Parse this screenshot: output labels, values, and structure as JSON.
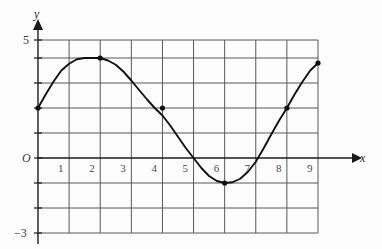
{
  "figure": {
    "axis_label_x": "x",
    "axis_label_y": "y",
    "origin_label": "O",
    "y_top_label": "5",
    "y_bottom_label": "−3"
  },
  "chart_data": {
    "type": "line",
    "title": "",
    "xlabel": "x",
    "ylabel": "y",
    "xlim": [
      0,
      9
    ],
    "ylim": [
      -3,
      5
    ],
    "grid": true,
    "legend": "none",
    "xticks": [
      "1",
      "2",
      "3",
      "4",
      "5",
      "6",
      "7",
      "8",
      "9"
    ],
    "xtick_values": [
      1,
      2,
      3,
      4,
      5,
      6,
      7,
      8,
      9
    ],
    "yticks": [
      "5",
      "−3"
    ],
    "ytick_values": [
      5,
      -3
    ],
    "marked_points": [
      {
        "x": 0,
        "y": 2
      },
      {
        "x": 2,
        "y": 4
      },
      {
        "x": 4,
        "y": 2
      },
      {
        "x": 6,
        "y": -1
      },
      {
        "x": 8,
        "y": 2
      },
      {
        "x": 9,
        "y": 3.8
      }
    ],
    "x": [
      0,
      0.25,
      0.5,
      0.75,
      1,
      1.25,
      1.5,
      1.75,
      2,
      2.25,
      2.5,
      2.75,
      3,
      3.25,
      3.5,
      3.75,
      4,
      4.25,
      4.5,
      4.75,
      5,
      5.25,
      5.5,
      5.75,
      6,
      6.25,
      6.5,
      6.75,
      7,
      7.25,
      7.5,
      7.75,
      8,
      8.25,
      8.5,
      8.75,
      9
    ],
    "y": [
      2.0,
      2.55,
      3.06,
      3.5,
      3.77,
      3.95,
      4.0,
      4.0,
      4.0,
      3.9,
      3.73,
      3.45,
      3.1,
      2.72,
      2.35,
      2.0,
      1.7,
      1.3,
      0.85,
      0.4,
      0.0,
      -0.4,
      -0.72,
      -0.92,
      -1.0,
      -0.97,
      -0.83,
      -0.55,
      -0.15,
      0.38,
      0.95,
      1.5,
      2.0,
      2.55,
      3.05,
      3.5,
      3.8
    ]
  }
}
